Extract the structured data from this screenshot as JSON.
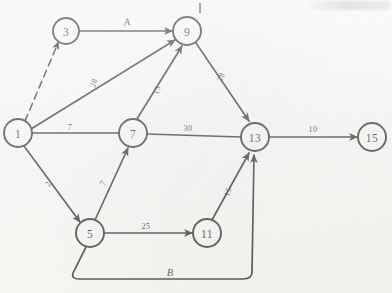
{
  "figure": {
    "type": "directed-network-diagram",
    "background_color": "#fbfbf9",
    "ink_color": "#171717"
  },
  "nodes": [
    {
      "id": "3",
      "label": "3",
      "cx": 66,
      "cy": 31,
      "r": 13
    },
    {
      "id": "9",
      "label": "9",
      "cx": 187,
      "cy": 31,
      "r": 14
    },
    {
      "id": "1",
      "label": "1",
      "cx": 18,
      "cy": 133,
      "r": 14
    },
    {
      "id": "7",
      "label": "7",
      "cx": 133,
      "cy": 133,
      "r": 14
    },
    {
      "id": "13",
      "label": "13",
      "cx": 255,
      "cy": 137,
      "r": 14
    },
    {
      "id": "15",
      "label": "15",
      "cx": 372,
      "cy": 137,
      "r": 14
    },
    {
      "id": "5",
      "label": "5",
      "cx": 90,
      "cy": 233,
      "r": 14
    },
    {
      "id": "11",
      "label": "11",
      "cx": 207,
      "cy": 233,
      "r": 14
    }
  ],
  "edges": [
    {
      "id": "e-1-3",
      "from": "1",
      "to": "3",
      "label": "",
      "style": "dashed",
      "label_x": 0,
      "label_y": 0,
      "label_rotate": 0
    },
    {
      "id": "e-3-9",
      "from": "3",
      "to": "9",
      "label": "A",
      "style": "solid",
      "label_x": 127,
      "label_y": 22,
      "label_rotate": 0
    },
    {
      "id": "e-1-9",
      "from": "1",
      "to": "9",
      "label": "28",
      "style": "solid",
      "label_x": 94,
      "label_y": 83,
      "label_rotate": -72
    },
    {
      "id": "e-7-9",
      "from": "7",
      "to": "9",
      "label": "13",
      "style": "solid",
      "label_x": 157,
      "label_y": 90,
      "label_rotate": -75
    },
    {
      "id": "e-1-7",
      "from": "1",
      "to": "7",
      "label": "7",
      "style": "solid",
      "label_x": 70,
      "label_y": 127,
      "label_rotate": 0
    },
    {
      "id": "e-9-13",
      "from": "9",
      "to": "13",
      "label": "28",
      "style": "solid",
      "label_x": 221,
      "label_y": 77,
      "label_rotate": -66
    },
    {
      "id": "e-7-13",
      "from": "7",
      "to": "13",
      "label": "30",
      "style": "solid",
      "label_x": 188,
      "label_y": 128,
      "label_rotate": 0
    },
    {
      "id": "e-13-15",
      "from": "13",
      "to": "15",
      "label": "10",
      "style": "solid",
      "label_x": 313,
      "label_y": 129,
      "label_rotate": 0
    },
    {
      "id": "e-1-5",
      "from": "1",
      "to": "5",
      "label": "2",
      "style": "solid",
      "label_x": 48,
      "label_y": 184,
      "label_rotate": -62
    },
    {
      "id": "e-5-7",
      "from": "5",
      "to": "7",
      "label": "7",
      "style": "solid",
      "label_x": 103,
      "label_y": 183,
      "label_rotate": -66
    },
    {
      "id": "e-5-11",
      "from": "5",
      "to": "11",
      "label": "25",
      "style": "solid",
      "label_x": 146,
      "label_y": 226,
      "label_rotate": 0
    },
    {
      "id": "e-11-13",
      "from": "11",
      "to": "13",
      "label": "15",
      "style": "solid",
      "label_x": 228,
      "label_y": 192,
      "label_rotate": -72
    },
    {
      "id": "e-5-13",
      "from": "5",
      "to": "13",
      "label": "B",
      "style": "curved",
      "label_x": 170,
      "label_y": 275,
      "label_rotate": 0
    }
  ],
  "annotations": {
    "tick_mark_top": "|"
  }
}
